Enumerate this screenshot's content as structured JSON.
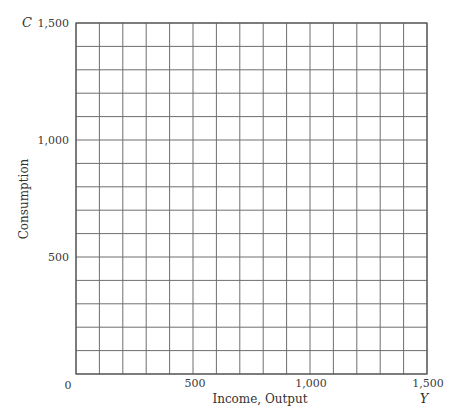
{
  "chart_data": {
    "type": "line",
    "title": "",
    "xlabel": "Income, Output",
    "ylabel": "Consumption",
    "x_variable": "Y",
    "y_variable": "C",
    "xlim": [
      0,
      1500
    ],
    "ylim": [
      0,
      1500
    ],
    "x_ticks": [
      {
        "value": 0,
        "label": "0"
      },
      {
        "value": 500,
        "label": "500"
      },
      {
        "value": 1000,
        "label": "1,000"
      },
      {
        "value": 1500,
        "label": "1,500"
      }
    ],
    "y_ticks": [
      {
        "value": 500,
        "label": "500"
      },
      {
        "value": 1000,
        "label": "1,000"
      },
      {
        "value": 1500,
        "label": "1,500"
      }
    ],
    "grid": true,
    "grid_step_x": 100,
    "grid_step_y": 100,
    "series": [],
    "legend": null
  },
  "labels": {
    "origin": "0",
    "x_axis_title": "Income, Output",
    "y_axis_title": "Consumption",
    "x_var": "Y",
    "y_var": "C",
    "x_tick_500": "500",
    "x_tick_1000": "1,000",
    "x_tick_1500": "1,500",
    "y_tick_500": "500",
    "y_tick_1000": "1,000",
    "y_tick_1500": "1,500"
  },
  "colors": {
    "grid": "#6e6e6e",
    "frame": "#555555",
    "text": "#333333",
    "background": "#ffffff"
  }
}
